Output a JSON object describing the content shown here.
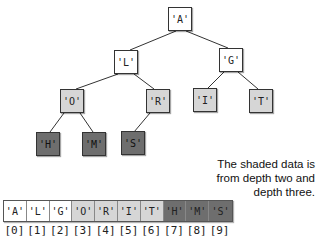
{
  "tree": {
    "nodes": [
      {
        "label": "'A'",
        "depth": 0
      },
      {
        "label": "'L'",
        "depth": 1
      },
      {
        "label": "'G'",
        "depth": 1
      },
      {
        "label": "'O'",
        "depth": 2
      },
      {
        "label": "'R'",
        "depth": 2
      },
      {
        "label": "'I'",
        "depth": 2
      },
      {
        "label": "'T'",
        "depth": 2
      },
      {
        "label": "'H'",
        "depth": 3
      },
      {
        "label": "'M'",
        "depth": 3
      },
      {
        "label": "'S'",
        "depth": 3
      }
    ]
  },
  "caption": {
    "line1": "The shaded data is",
    "line2": "from depth two and",
    "line3": "depth three."
  },
  "array": {
    "cells": [
      "'A'",
      "'L'",
      "'G'",
      "'O'",
      "'R'",
      "'I'",
      "'T'",
      "'H'",
      "'M'",
      "'S'"
    ],
    "indices": [
      "[0]",
      "[1]",
      "[2]",
      "[3]",
      "[4]",
      "[5]",
      "[6]",
      "[7]",
      "[8]",
      "[9]"
    ]
  },
  "colors": {
    "depth_0_1": "#ffffff",
    "depth_2": "#d6d6d6",
    "depth_3": "#6e6e6e"
  }
}
